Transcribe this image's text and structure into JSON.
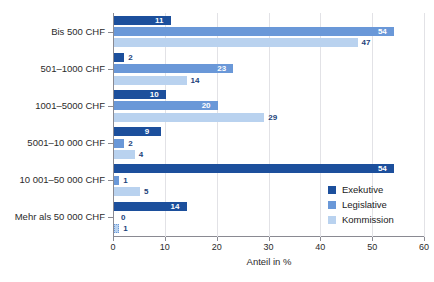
{
  "chart_data": {
    "type": "bar",
    "orientation": "horizontal",
    "title": "",
    "xlabel": "Anteil in %",
    "ylabel": "",
    "xlim": [
      0,
      60
    ],
    "xticks": [
      "0",
      "10",
      "20",
      "30",
      "40",
      "50",
      "60"
    ],
    "grid": "vertical",
    "legend_position": "bottom-right",
    "categories": [
      "Bis 500 CHF",
      "501–1000 CHF",
      "1001–5000 CHF",
      "5001–10 000 CHF",
      "10 001–50 000 CHF",
      "Mehr als 50 000 CHF"
    ],
    "series": [
      {
        "name": "Exekutive",
        "color": "#1c4f9c",
        "values": [
          11,
          2,
          10,
          9,
          54,
          14
        ]
      },
      {
        "name": "Legislative",
        "color": "#6a98d8",
        "values": [
          54,
          23,
          20,
          2,
          1,
          0
        ]
      },
      {
        "name": "Kommission",
        "color": "#b9d2ef",
        "values": [
          47,
          14,
          29,
          4,
          5,
          1
        ]
      }
    ],
    "value_labels": [
      [
        "11",
        "54",
        "47"
      ],
      [
        "2",
        "23",
        "14"
      ],
      [
        "10",
        "20",
        "29"
      ],
      [
        "9",
        "2",
        "4"
      ],
      [
        "54",
        "1",
        "5"
      ],
      [
        "14",
        "0",
        "1"
      ]
    ]
  },
  "legend": {
    "items": [
      {
        "label": "Exekutive"
      },
      {
        "label": "Legislative"
      },
      {
        "label": "Kommission"
      }
    ]
  },
  "axis": {
    "x_title": "Anteil in %",
    "x_ticks": [
      "0",
      "10",
      "20",
      "30",
      "40",
      "50",
      "60"
    ]
  },
  "header": {
    "cut_off_title": ""
  }
}
